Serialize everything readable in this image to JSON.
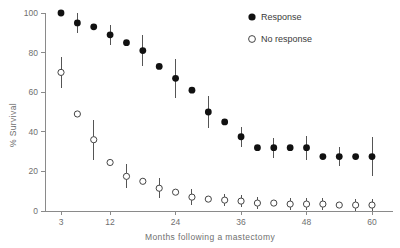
{
  "chart_data": {
    "type": "scatter",
    "title": "",
    "xlabel": "Months following a mastectomy",
    "ylabel": "% Survival",
    "xlim": [
      0,
      63
    ],
    "ylim": [
      0,
      100
    ],
    "xticks": [
      3,
      12,
      24,
      36,
      48,
      60
    ],
    "xtick_labels": [
      "3",
      "12",
      "24",
      "36",
      "48",
      "60"
    ],
    "yticks": [
      0,
      20,
      40,
      60,
      80,
      100
    ],
    "ytick_labels": [
      "0",
      "20",
      "40",
      "60",
      "80",
      "100"
    ],
    "grid": false,
    "legend_position": "top-right",
    "error_bars": "vertical",
    "series": [
      {
        "name": "Response",
        "marker": "filled-circle",
        "color": "#111111",
        "x": [
          3,
          6,
          9,
          12,
          15,
          18,
          21,
          24,
          27,
          30,
          33,
          36,
          39,
          42,
          45,
          48,
          51,
          54,
          57,
          60
        ],
        "values": [
          100,
          95,
          93,
          89,
          85,
          81,
          73,
          67,
          61,
          50,
          45,
          37.5,
          32,
          32,
          32,
          32,
          27.5,
          27.5,
          27.5,
          27.5
        ],
        "err_low": [
          0,
          5,
          0,
          5,
          0,
          8,
          0,
          10,
          0,
          8,
          0,
          5,
          0,
          5,
          0,
          6,
          0,
          5,
          0,
          10
        ],
        "err_high": [
          0,
          5,
          0,
          5,
          0,
          8,
          0,
          10,
          0,
          8,
          0,
          5,
          0,
          5,
          0,
          6,
          0,
          5,
          0,
          10
        ]
      },
      {
        "name": "No response",
        "marker": "open-circle",
        "color": "#444444",
        "x": [
          3,
          6,
          9,
          12,
          15,
          18,
          21,
          24,
          27,
          30,
          33,
          36,
          39,
          42,
          45,
          48,
          51,
          54,
          57,
          60
        ],
        "values": [
          70,
          49,
          36,
          24.5,
          17.5,
          15,
          11.5,
          9.5,
          7,
          6,
          5.5,
          5,
          4,
          4,
          3.5,
          3.5,
          3.5,
          3,
          3,
          3
        ],
        "err_low": [
          8,
          0,
          10,
          0,
          6,
          0,
          5,
          0,
          4,
          0,
          3,
          3,
          3,
          0,
          3,
          3,
          3,
          0,
          3,
          3
        ],
        "err_high": [
          8,
          0,
          10,
          0,
          6,
          0,
          5,
          0,
          4,
          0,
          3,
          3,
          3,
          0,
          3,
          3,
          3,
          0,
          3,
          3
        ]
      }
    ]
  },
  "legend": {
    "items": [
      {
        "label": "Response",
        "marker": "filled-circle"
      },
      {
        "label": "No response",
        "marker": "open-circle"
      }
    ]
  }
}
